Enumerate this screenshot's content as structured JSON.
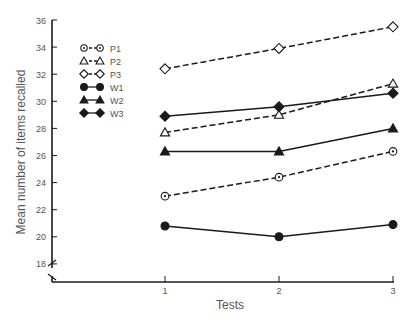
{
  "chart_data": {
    "type": "line",
    "title": "",
    "xlabel": "Tests",
    "ylabel": "Mean number of items recalled",
    "x": [
      1,
      2,
      3
    ],
    "x_tick_labels": [
      "1",
      "2",
      "3"
    ],
    "y_ticks": [
      18,
      20,
      22,
      24,
      26,
      28,
      30,
      32,
      34,
      36
    ],
    "ylim": [
      18,
      36
    ],
    "y_axis_break": true,
    "grid": false,
    "legend_position": "upper-left inside",
    "series": [
      {
        "name": "P1",
        "marker": "dotted-circle",
        "line": "dashed",
        "values": [
          23.0,
          24.4,
          26.3
        ]
      },
      {
        "name": "P2",
        "marker": "open-triangle",
        "line": "dashed",
        "values": [
          27.7,
          29.0,
          31.3
        ]
      },
      {
        "name": "P3",
        "marker": "open-diamond",
        "line": "dashed",
        "values": [
          32.4,
          33.9,
          35.5
        ]
      },
      {
        "name": "W1",
        "marker": "filled-circle",
        "line": "solid",
        "values": [
          20.8,
          20.0,
          20.9
        ]
      },
      {
        "name": "W2",
        "marker": "filled-triangle",
        "line": "solid",
        "values": [
          26.3,
          26.3,
          28.0
        ]
      },
      {
        "name": "W3",
        "marker": "filled-diamond",
        "line": "solid",
        "values": [
          28.9,
          29.6,
          30.6
        ]
      }
    ]
  },
  "colors": {
    "ink": "#1a1a1a",
    "text": "#555555",
    "background": "#ffffff"
  }
}
